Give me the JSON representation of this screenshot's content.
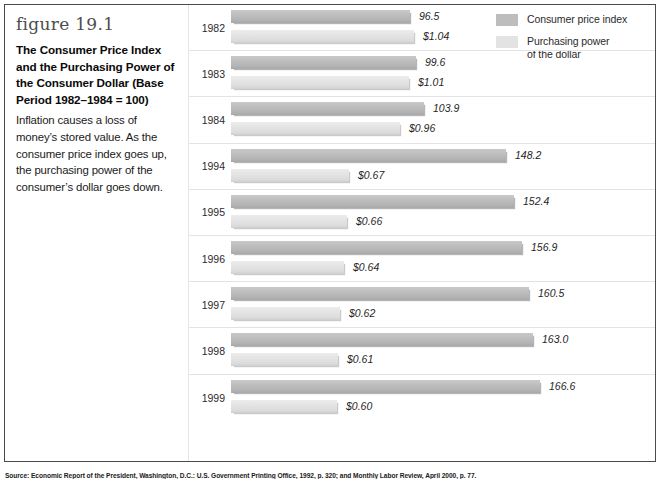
{
  "figure": {
    "number": "figure 19.1",
    "title": "The Consumer Price Index and the Purchasing Power of the Consumer Dollar (Base Period 1982–1984 = 100)",
    "description": "Inflation causes a loss of money’s stored value. As the consumer price index goes up, the purchasing power of the consumer’s dollar goes down."
  },
  "legend": {
    "position": "top-right",
    "items": [
      {
        "label": "Consumer price index",
        "color": "#bdbdbd",
        "swatch_name": "legend-swatch-cpi"
      },
      {
        "label": "Purchasing power\nof the dollar",
        "label_line1": "Purchasing power",
        "label_line2": "of the dollar",
        "color": "#e3e3e3",
        "swatch_name": "legend-swatch-ppd"
      }
    ]
  },
  "source_note": "Source: Economic Report of the President, Washington, D.C.: U.S. Government Printing Office, 1992, p. 320; and Monthly Labor Review, April 2000, p. 77.",
  "chart_data": {
    "type": "bar",
    "orientation": "horizontal",
    "title": "The Consumer Price Index and the Purchasing Power of the Consumer Dollar (Base Period 1982–1984 = 100)",
    "xlabel": "",
    "ylabel": "",
    "categories": [
      "1982",
      "1983",
      "1984",
      "1994",
      "1995",
      "1996",
      "1997",
      "1998",
      "1999"
    ],
    "grid": false,
    "legend_position": "top-right",
    "series": [
      {
        "name": "Consumer price index",
        "color": "#bdbdbd",
        "values": [
          96.5,
          99.6,
          103.9,
          148.2,
          152.4,
          156.9,
          160.5,
          163.0,
          166.6
        ],
        "labels": [
          "96.5",
          "99.6",
          "103.9",
          "148.2",
          "152.4",
          "156.9",
          "160.5",
          "163.0",
          "166.6"
        ],
        "axis_max": 185
      },
      {
        "name": "Purchasing power of the dollar",
        "color": "#e3e3e3",
        "values": [
          1.04,
          1.01,
          0.96,
          0.67,
          0.66,
          0.64,
          0.62,
          0.61,
          0.6
        ],
        "labels": [
          "$1.04",
          "$1.01",
          "$0.96",
          "$0.67",
          "$0.66",
          "$0.64",
          "$0.62",
          "$0.61",
          "$0.60"
        ],
        "axis_max": 1.95
      }
    ]
  }
}
